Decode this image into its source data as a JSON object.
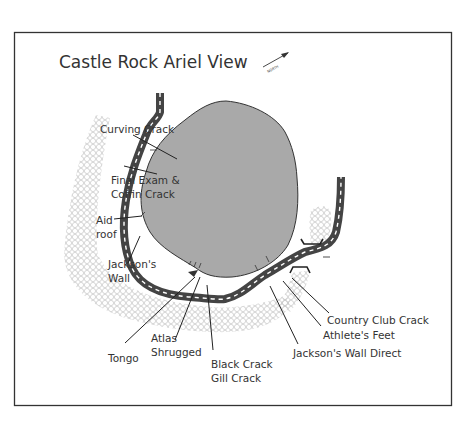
{
  "map": {
    "title": "Castle Rock Ariel View",
    "north_label": "NORTH",
    "colors": {
      "background": "#ffffff",
      "frame": "#333333",
      "rock_fill": "#a9a9a9",
      "rock_stroke": "#333333",
      "road": "#444444",
      "road_dash": "#ffffff",
      "talus_pattern": "#c8c8c8",
      "leader_line": "#222222",
      "text": "#333333"
    },
    "routes": [
      {
        "id": "curving-crack",
        "label_lines": [
          "Curving Crack"
        ]
      },
      {
        "id": "final-exam-coffin-crack",
        "label_lines": [
          "Final Exam &",
          "Coffin Crack"
        ]
      },
      {
        "id": "aid-roof",
        "label_lines": [
          "Aid",
          "roof"
        ]
      },
      {
        "id": "jacksons-wall",
        "label_lines": [
          "Jackson's",
          "Wall"
        ]
      },
      {
        "id": "tongo",
        "label_lines": [
          "Tongo"
        ]
      },
      {
        "id": "atlas-shrugged",
        "label_lines": [
          "Atlas",
          "Shrugged"
        ]
      },
      {
        "id": "black-crack-gill-crack",
        "label_lines": [
          "Black Crack",
          "Gill Crack"
        ]
      },
      {
        "id": "jacksons-wall-direct",
        "label_lines": [
          "Jackson's Wall Direct"
        ]
      },
      {
        "id": "athletes-feet",
        "label_lines": [
          "Athlete's Feet"
        ]
      },
      {
        "id": "country-club-crack",
        "label_lines": [
          "Country Club Crack"
        ]
      }
    ]
  }
}
